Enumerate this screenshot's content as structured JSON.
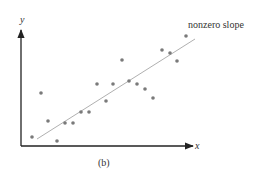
{
  "figure": {
    "caption": "(b)",
    "x_axis_label": "x",
    "y_axis_label": "y",
    "trend_line_label": "nonzero slope",
    "colors": {
      "axis": "#222222",
      "points": "#7a7a7a",
      "trend_line": "#b0b0b0",
      "text": "#333333"
    }
  },
  "chart_data": {
    "type": "scatter",
    "title": "",
    "xlabel": "x",
    "ylabel": "y",
    "caption": "(b)",
    "grid": false,
    "legend": null,
    "xlim": [
      0,
      172
    ],
    "ylim": [
      0,
      115
    ],
    "points": [
      {
        "x": 11,
        "y": 9
      },
      {
        "x": 20,
        "y": 53
      },
      {
        "x": 27,
        "y": 25
      },
      {
        "x": 36,
        "y": 5
      },
      {
        "x": 44,
        "y": 23
      },
      {
        "x": 52,
        "y": 23
      },
      {
        "x": 60,
        "y": 34
      },
      {
        "x": 68,
        "y": 34
      },
      {
        "x": 76,
        "y": 62
      },
      {
        "x": 85,
        "y": 45
      },
      {
        "x": 92,
        "y": 62
      },
      {
        "x": 101,
        "y": 86
      },
      {
        "x": 108,
        "y": 65
      },
      {
        "x": 116,
        "y": 62
      },
      {
        "x": 124,
        "y": 57
      },
      {
        "x": 132,
        "y": 48
      },
      {
        "x": 141,
        "y": 96
      },
      {
        "x": 149,
        "y": 93
      },
      {
        "x": 156,
        "y": 85
      },
      {
        "x": 165,
        "y": 110
      }
    ],
    "trend_line": {
      "label": "nonzero slope",
      "start": {
        "x": 16,
        "y": 7
      },
      "end": {
        "x": 174,
        "y": 107
      }
    },
    "annotations": [
      {
        "text": "nonzero slope",
        "anchor": "end of trend line"
      }
    ],
    "axis_ticks": "none"
  }
}
